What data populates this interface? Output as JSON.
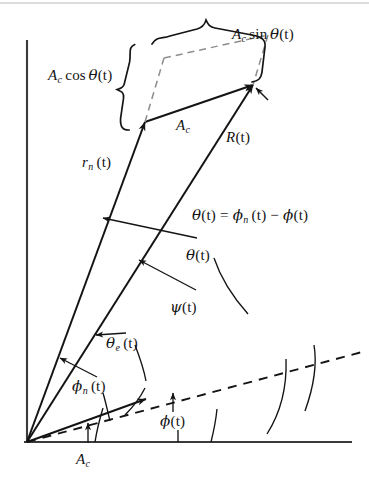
{
  "figure": {
    "kind": "phasor-diagram",
    "background": "#ffffff",
    "ink_color": "#141414",
    "width": 369,
    "height": 495
  },
  "axes": {
    "origin": {
      "x": 27,
      "y": 442
    },
    "vertical_axis": {
      "x": 27,
      "y_top": 40,
      "y_bottom": 442
    },
    "horizontal_axis": {
      "y": 442,
      "x_left": 27,
      "x_right": 352
    }
  },
  "vectors": [
    {
      "name": "carrier-baseline",
      "label": "A_c",
      "label_text": "A",
      "label_sub": "c",
      "from": {
        "x": 27,
        "y": 442
      },
      "to": {
        "x": 146,
        "y": 399
      },
      "style": "solid",
      "arrow": true
    },
    {
      "name": "rn-vector",
      "label": "r_n(t)",
      "label_text": "r",
      "label_sub": "n",
      "label_arg": "(t)",
      "from": {
        "x": 27,
        "y": 442
      },
      "to": {
        "x": 145,
        "y": 122
      },
      "style": "solid",
      "arrow": true
    },
    {
      "name": "resultant-vector",
      "label": "R(t)",
      "label_text": "R",
      "label_arg": "(t)",
      "from": {
        "x": 27,
        "y": 442
      },
      "to": {
        "x": 253,
        "y": 85
      },
      "style": "solid",
      "arrow": true
    },
    {
      "name": "carrier-vector-top",
      "label": "A_c",
      "label_text": "A",
      "label_sub": "c",
      "from": {
        "x": 145,
        "y": 122
      },
      "to": {
        "x": 253,
        "y": 85
      },
      "style": "solid",
      "arrow": true
    },
    {
      "name": "phase-reference-dashed",
      "label": "",
      "from": {
        "x": 27,
        "y": 442
      },
      "to": {
        "x": 362,
        "y": 352
      },
      "style": "dashed",
      "arrow": false
    }
  ],
  "labels": {
    "ac_sin_theta": {
      "lead": "A",
      "sub": "c",
      "fn": "sin",
      "greek": "θ",
      "arg": "(t)"
    },
    "ac_cos_theta": {
      "lead": "A",
      "sub": "c",
      "fn": "cos",
      "greek": "θ",
      "arg": "(t)"
    },
    "ac_upper": {
      "lead": "A",
      "sub": "c"
    },
    "ac_lower": {
      "lead": "A",
      "sub": "c"
    },
    "r_of_t": {
      "lead": "R",
      "arg": "(t)"
    },
    "rn_of_t": {
      "lead": "r",
      "sub": "n",
      "arg": "(t)"
    },
    "theta_equation": {
      "lhs_greek": "θ",
      "lhs_arg": "(t)",
      "equals": "=",
      "rhs1_greek": "ϕ",
      "rhs1_sub": "n",
      "rhs1_arg": "(t)",
      "minus": "−",
      "rhs2_greek": "ϕ",
      "rhs2_arg": "(t)"
    },
    "theta_of_t": {
      "greek": "θ",
      "arg": "(t)"
    },
    "psi_of_t": {
      "greek": "ψ",
      "arg": "(t)"
    },
    "theta_e_of_t": {
      "greek": "θ",
      "sub": "e",
      "arg": "(t)"
    },
    "phi_n_of_t": {
      "greek": "ϕ",
      "sub": "n",
      "arg": "(t)"
    },
    "phi_of_t": {
      "greek": "ϕ",
      "arg": "(t)"
    }
  },
  "arcs": [
    {
      "name": "phi-arc",
      "desc": "angle from horizontal axis to dashed phase reference",
      "label": "phi_of_t"
    },
    {
      "name": "phi-n-arc",
      "desc": "angle from horizontal axis to r_n(t) vector",
      "label": "phi_n_of_t"
    },
    {
      "name": "theta-e-arc",
      "desc": "angle between A_c baseline and r_n(t)",
      "label": "theta_e_of_t"
    },
    {
      "name": "psi-arc",
      "desc": "angle from dashed reference to R(t)",
      "label": "psi_of_t"
    },
    {
      "name": "theta-arc",
      "desc": "angle from dashed reference to r_n(t)",
      "label": "theta_of_t"
    }
  ],
  "braces": [
    {
      "name": "cos-brace",
      "orientation": "left",
      "label": "ac_cos_theta"
    },
    {
      "name": "sin-brace",
      "orientation": "top",
      "label": "ac_sin_theta"
    }
  ],
  "dashed_parallelogram": {
    "name": "component-parallelogram",
    "points": [
      {
        "x": 145,
        "y": 122
      },
      {
        "x": 163,
        "y": 60
      },
      {
        "x": 268,
        "y": 36
      },
      {
        "x": 253,
        "y": 85
      }
    ]
  }
}
